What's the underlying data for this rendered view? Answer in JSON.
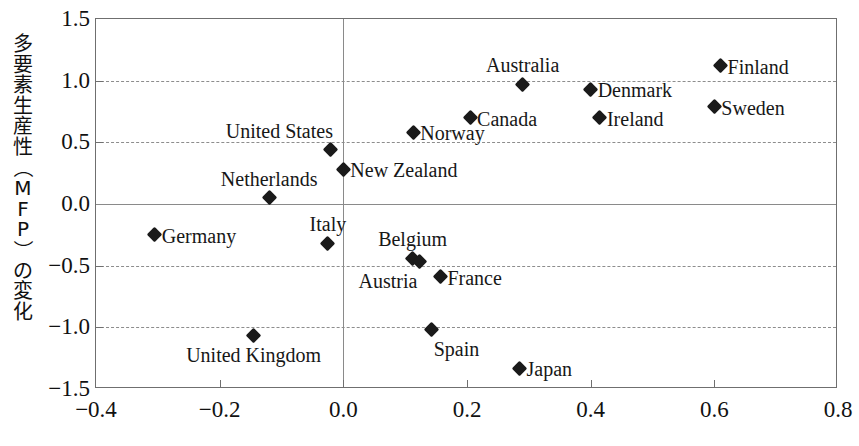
{
  "chart_data": {
    "type": "scatter",
    "title": "",
    "ylabel": "多要素生産性（MFP）の変化",
    "xlabel": "",
    "xlim": [
      -0.4,
      0.8
    ],
    "ylim": [
      -1.5,
      1.5
    ],
    "xticks": [
      "-0.4",
      "-0.2",
      "0.0",
      "0.2",
      "0.4",
      "0.6",
      "0.8"
    ],
    "xtick_values": [
      -0.4,
      -0.2,
      0.0,
      0.2,
      0.4,
      0.6,
      0.8
    ],
    "yticks": [
      "1.5",
      "1.0",
      "0.5",
      "0.0",
      "-0.5",
      "-1.0",
      "-1.5"
    ],
    "ytick_values": [
      1.5,
      1.0,
      0.5,
      0.0,
      -0.5,
      -1.0,
      -1.5
    ],
    "grid": true,
    "grid_axis": "y",
    "legend": "none",
    "marker": "diamond",
    "marker_color": "#1a1a1a",
    "points": [
      {
        "label": "Finland",
        "x": 0.61,
        "y": 1.12,
        "pos": "right"
      },
      {
        "label": "Australia",
        "x": 0.29,
        "y": 0.97,
        "pos": "above"
      },
      {
        "label": "Denmark",
        "x": 0.4,
        "y": 0.93,
        "pos": "right"
      },
      {
        "label": "Sweden",
        "x": 0.6,
        "y": 0.79,
        "pos": "right"
      },
      {
        "label": "Canada",
        "x": 0.205,
        "y": 0.7,
        "pos": "right"
      },
      {
        "label": "Ireland",
        "x": 0.415,
        "y": 0.7,
        "pos": "right"
      },
      {
        "label": "Norway",
        "x": 0.113,
        "y": 0.58,
        "pos": "right"
      },
      {
        "label": "United States",
        "x": -0.02,
        "y": 0.44,
        "pos": "above-left"
      },
      {
        "label": "New Zealand",
        "x": 0.0,
        "y": 0.28,
        "pos": "right"
      },
      {
        "label": "Netherlands",
        "x": -0.12,
        "y": 0.05,
        "pos": "above"
      },
      {
        "label": "Germany",
        "x": -0.305,
        "y": -0.25,
        "pos": "right"
      },
      {
        "label": "Italy",
        "x": -0.025,
        "y": -0.32,
        "pos": "above"
      },
      {
        "label": "Belgium",
        "x": 0.112,
        "y": -0.44,
        "pos": "above"
      },
      {
        "label": "Austria",
        "x": 0.123,
        "y": -0.47,
        "pos": "below-left"
      },
      {
        "label": "France",
        "x": 0.157,
        "y": -0.59,
        "pos": "right"
      },
      {
        "label": "Spain",
        "x": 0.143,
        "y": -1.02,
        "pos": "below-right"
      },
      {
        "label": "United Kingdom",
        "x": -0.145,
        "y": -1.07,
        "pos": "below"
      },
      {
        "label": "Japan",
        "x": 0.285,
        "y": -1.33,
        "pos": "right"
      }
    ]
  },
  "axis_title": {
    "y_chars": [
      "多",
      "要",
      "素",
      "生",
      "産",
      "性",
      "（",
      "M",
      "F",
      "P",
      "）",
      "の",
      "変",
      "化"
    ]
  }
}
